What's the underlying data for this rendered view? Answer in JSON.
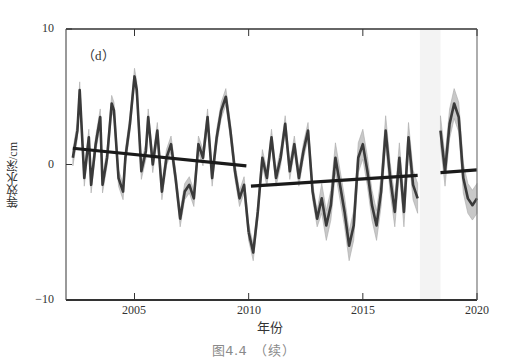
{
  "figure": {
    "panel_label": "（d）",
    "caption": "图4.4　（续）",
    "ylabel": "等效水深/cm",
    "xlabel": "年份",
    "yticks": [
      "10",
      "0",
      "−10"
    ],
    "xticks": [
      "2005",
      "2010",
      "2015",
      "2020"
    ]
  },
  "chart_data": {
    "type": "line",
    "title": "（d）",
    "caption": "图4.4 （续）",
    "xlabel": "年份",
    "ylabel": "等效水深/cm",
    "xlim": [
      2002.0,
      2020.0
    ],
    "ylim": [
      -10,
      10
    ],
    "grid": false,
    "legend": null,
    "xticks": [
      2005,
      2010,
      2015,
      2020
    ],
    "yticks": [
      -10,
      0,
      10
    ],
    "gap_shaded": [
      2017.5,
      2018.4
    ],
    "colors": {
      "series": "#3a3a3a",
      "uncertainty_band": "#c8c8c8",
      "trend": "#1a1a1a",
      "gap": "#f3f3f3"
    },
    "series": [
      {
        "name": "equivalent water height (GRACE segment 1)",
        "x": [
          2002.3,
          2002.5,
          2002.6,
          2002.8,
          2003.0,
          2003.1,
          2003.3,
          2003.5,
          2003.6,
          2003.8,
          2004.0,
          2004.1,
          2004.3,
          2004.5,
          2004.6,
          2004.8,
          2005.0,
          2005.1,
          2005.3,
          2005.5,
          2005.6,
          2005.8,
          2006.0,
          2006.2,
          2006.4,
          2006.6,
          2006.8,
          2007.0,
          2007.2,
          2007.4,
          2007.6,
          2007.8,
          2008.0,
          2008.2,
          2008.4,
          2008.6,
          2008.8,
          2009.0,
          2009.2,
          2009.4,
          2009.6,
          2009.8,
          2010.0
        ],
        "y": [
          0.5,
          2.5,
          5.5,
          -1.0,
          2.0,
          -1.5,
          1.5,
          3.5,
          -1.5,
          0.5,
          4.5,
          4.0,
          -1.0,
          -2.0,
          0.5,
          3.0,
          6.5,
          5.5,
          -0.5,
          1.0,
          3.5,
          0.0,
          2.5,
          -2.0,
          0.5,
          1.5,
          -1.0,
          -4.0,
          -2.0,
          -1.5,
          -2.5,
          1.5,
          0.5,
          3.5,
          -1.0,
          2.0,
          4.0,
          5.0,
          2.5,
          -0.5,
          -2.5,
          -1.5,
          -5.0
        ]
      },
      {
        "name": "equivalent water height (GRACE segment 2)",
        "x": [
          2010.0,
          2010.2,
          2010.4,
          2010.6,
          2010.8,
          2011.0,
          2011.2,
          2011.4,
          2011.6,
          2011.8,
          2012.0,
          2012.2,
          2012.4,
          2012.6,
          2012.8,
          2013.0,
          2013.2,
          2013.4,
          2013.6,
          2013.8,
          2014.0,
          2014.2,
          2014.4,
          2014.6,
          2014.8,
          2015.0,
          2015.2,
          2015.4,
          2015.6,
          2015.8,
          2016.0,
          2016.2,
          2016.4,
          2016.6,
          2016.8,
          2017.0,
          2017.2,
          2017.4
        ],
        "y": [
          -5.0,
          -6.5,
          -3.5,
          0.5,
          -1.0,
          2.0,
          -1.0,
          0.5,
          3.0,
          -0.5,
          1.5,
          -1.0,
          1.0,
          2.5,
          -2.0,
          -4.0,
          -2.5,
          -4.5,
          -3.0,
          0.5,
          -1.5,
          -3.5,
          -6.0,
          -4.5,
          0.5,
          1.5,
          -0.5,
          -3.0,
          -4.5,
          -2.0,
          2.5,
          -1.0,
          -3.5,
          0.5,
          -3.5,
          2.0,
          -1.5,
          -2.5
        ]
      },
      {
        "name": "equivalent water height (GRACE-FO segment)",
        "x": [
          2018.4,
          2018.6,
          2018.8,
          2019.0,
          2019.2,
          2019.4,
          2019.6,
          2019.8,
          2020.0
        ],
        "y": [
          2.5,
          -0.5,
          3.0,
          4.5,
          3.5,
          -1.0,
          -2.5,
          -3.0,
          -2.5
        ]
      }
    ],
    "trend_lines": [
      {
        "x": [
          2002.3,
          2009.9
        ],
        "y": [
          1.2,
          -0.1
        ]
      },
      {
        "x": [
          2010.1,
          2017.4
        ],
        "y": [
          -1.6,
          -0.8
        ]
      },
      {
        "x": [
          2018.4,
          2020.0
        ],
        "y": [
          -0.6,
          -0.4
        ]
      }
    ]
  }
}
